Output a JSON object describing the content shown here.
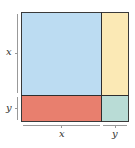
{
  "diagram": {
    "title": "",
    "regions": [
      {
        "id": "x-squared",
        "label": "",
        "color": "#bcdcf2"
      },
      {
        "id": "xy-right",
        "label": "",
        "color": "#fbe9b5"
      },
      {
        "id": "xy-bottom",
        "label": "",
        "color": "#e87f6e"
      },
      {
        "id": "y-squared",
        "label": "",
        "color": "#b9dcd6"
      }
    ],
    "side_labels": {
      "left_top": "x",
      "left_bottom": "y",
      "bottom_left": "x",
      "bottom_right": "y"
    }
  }
}
